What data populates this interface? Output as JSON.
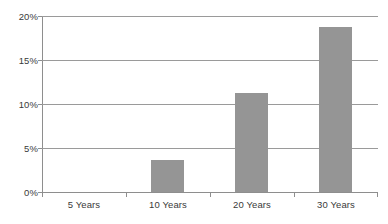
{
  "chart_data": {
    "type": "bar",
    "title": "",
    "subtitle": "",
    "xlabel": "",
    "ylabel": "",
    "categories": [
      "5 Years",
      "10 Years",
      "20 Years",
      "30 Years"
    ],
    "values": [
      0,
      3.6,
      11.2,
      18.7
    ],
    "value_labels": [
      "0%",
      "3.6%",
      "11.2%",
      "18.7%"
    ],
    "ylim": [
      0,
      20
    ],
    "ytick_values": [
      0,
      5,
      10,
      15,
      20
    ],
    "ytick_labels": [
      "0%",
      "5%",
      "10%",
      "15%",
      "20%"
    ],
    "grid": true,
    "legend": false,
    "legend_position": "none",
    "series": [
      {
        "name": "",
        "color": "#959595",
        "values": [
          0,
          3.6,
          11.2,
          18.7
        ]
      }
    ],
    "colors": {
      "bar_fill": "#959595",
      "gridline": "#9a9a9a",
      "axis": "#8e8e8e",
      "text": "#3a3a3a",
      "background": "#ffffff"
    }
  }
}
